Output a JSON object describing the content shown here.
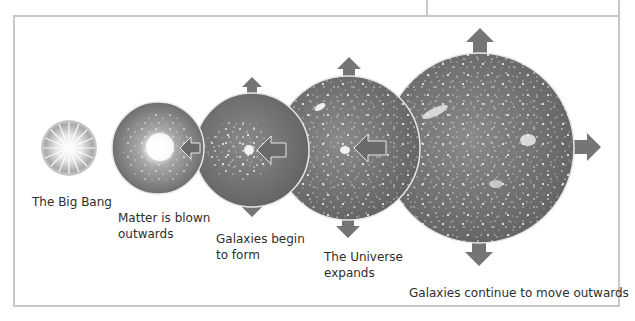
{
  "diagram": {
    "colors": {
      "frame": "#c8c8c8",
      "sphere": "#7a7a7a",
      "sphere_dark": "#5e5e5e",
      "arrow": "#757575",
      "text": "#2e2e2e"
    },
    "stages": [
      {
        "id": "big-bang",
        "label_lines": [
          "The Big Bang"
        ]
      },
      {
        "id": "matter-blown",
        "label_lines": [
          "Matter is blown",
          "outwards"
        ]
      },
      {
        "id": "galaxies-begin",
        "label_lines": [
          "Galaxies begin",
          "to form"
        ]
      },
      {
        "id": "universe-expands",
        "label_lines": [
          "The Universe",
          "expands"
        ]
      },
      {
        "id": "galaxies-continue",
        "label_lines": [
          "Galaxies continue to move outwards"
        ]
      }
    ]
  }
}
